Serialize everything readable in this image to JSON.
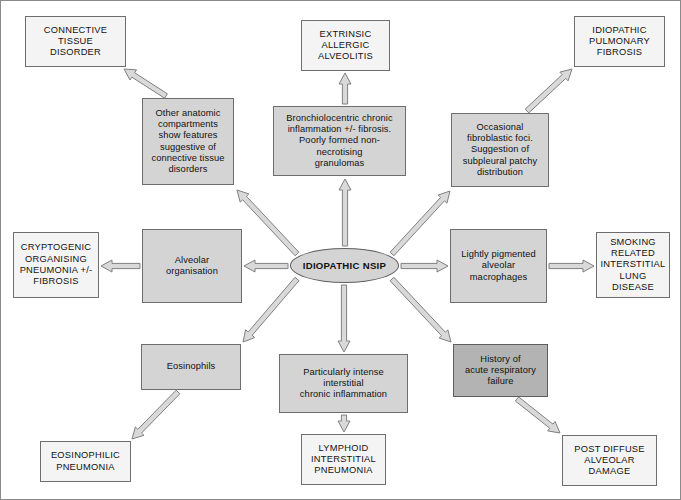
{
  "diagram": {
    "type": "radial-flow-chart",
    "colors": {
      "outcome_fill": "#f4f4f4",
      "feature_fill": "#d4d4d4",
      "feature_dark_fill": "#b3b3b3",
      "border": "#6e6e6e",
      "arrow_stroke": "#808080",
      "arrow_fill": "#d9d9d9",
      "text": "#111111",
      "canvas": "#ffffff"
    },
    "hub": {
      "id": "hub",
      "label": "IDIOPATHIC NSIP",
      "shape": "ellipse",
      "x": 289,
      "y": 247,
      "w": 109,
      "h": 35
    },
    "feature_nodes": [
      {
        "id": "other-anatomic-compartments",
        "label": "Other anatomic\ncompartments\nshow features\nsuggestive of\nconnective tissue\ndisorders",
        "style": "feature",
        "x": 141,
        "y": 97,
        "w": 92,
        "h": 87
      },
      {
        "id": "bronchiolocentric-inflammation",
        "label": "Bronchiolocentric chronic\ninflammation +/- fibrosis.\nPoorly formed non-necrotising\ngranulomas",
        "style": "feature",
        "x": 272,
        "y": 105,
        "w": 133,
        "h": 70
      },
      {
        "id": "fibroblastic-foci",
        "label": "Occasional\nfibroblastic foci.\nSuggestion of\nsubpleural patchy\ndistribution",
        "style": "feature",
        "x": 450,
        "y": 112,
        "w": 98,
        "h": 74
      },
      {
        "id": "alveolar-organisation",
        "label": "Alveolar\norganisation",
        "style": "feature",
        "x": 141,
        "y": 228,
        "w": 100,
        "h": 74
      },
      {
        "id": "lightly-pigmented-macrophages",
        "label": "Lightly pigmented\nalveolar\nmacrophages",
        "style": "feature",
        "x": 449,
        "y": 228,
        "w": 97,
        "h": 74
      },
      {
        "id": "eosinophils",
        "label": "Eosinophils",
        "style": "feature",
        "x": 140,
        "y": 343,
        "w": 100,
        "h": 46
      },
      {
        "id": "intense-interstitial-inflammation",
        "label": "Particularly intense\ninterstitial\nchronic inflammation",
        "style": "feature",
        "x": 278,
        "y": 353,
        "w": 129,
        "h": 59
      },
      {
        "id": "acute-respiratory-failure",
        "label": "History of\nacute respiratory\nfailure",
        "style": "feature-dark",
        "x": 452,
        "y": 343,
        "w": 95,
        "h": 53
      }
    ],
    "outcome_nodes": [
      {
        "id": "connective-tissue-disorder",
        "label": "CONNECTIVE\nTISSUE\nDISORDER",
        "style": "outcome",
        "x": 24,
        "y": 15,
        "w": 101,
        "h": 51
      },
      {
        "id": "extrinsic-allergic-alveolitis",
        "label": "EXTRINSIC\nALLERGIC\nALVEOLITIS",
        "style": "outcome",
        "x": 300,
        "y": 19,
        "w": 89,
        "h": 51
      },
      {
        "id": "idiopathic-pulmonary-fibrosis",
        "label": "IDIOPATHIC\nPULMONARY\nFIBROSIS",
        "style": "outcome",
        "x": 573,
        "y": 15,
        "w": 91,
        "h": 51
      },
      {
        "id": "cryptogenic-organising-pneumonia",
        "label": "CRYPTOGENIC\nORGANISING\nPNEUMONIA +/-\nFIBROSIS",
        "style": "outcome",
        "x": 12,
        "y": 231,
        "w": 86,
        "h": 66
      },
      {
        "id": "smoking-related-interstitial-lung-disease",
        "label": "SMOKING\nRELATED\nINTERSTITIAL\nLUNG DISEASE",
        "style": "outcome",
        "x": 595,
        "y": 231,
        "w": 74,
        "h": 66
      },
      {
        "id": "eosinophilic-pneumonia",
        "label": "EOSINOPHILIC\nPNEUMONIA",
        "style": "outcome",
        "x": 39,
        "y": 440,
        "w": 91,
        "h": 41
      },
      {
        "id": "lymphoid-interstitial-pneumonia",
        "label": "LYMPHOID\nINTERSTITIAL\nPNEUMONIA",
        "style": "outcome",
        "x": 300,
        "y": 433,
        "w": 85,
        "h": 51
      },
      {
        "id": "post-diffuse-alveolar-damage",
        "label": "POST DIFFUSE\nALVEOLAR\nDAMAGE",
        "style": "outcome",
        "x": 561,
        "y": 434,
        "w": 95,
        "h": 51
      }
    ],
    "edges": [
      {
        "id": "hub-to-other-anatomic",
        "from": "hub",
        "to": "other-anatomic-compartments",
        "x1": 296,
        "y1": 253,
        "x2": 236,
        "y2": 189
      },
      {
        "id": "other-anatomic-to-ctd",
        "from": "other-anatomic-compartments",
        "to": "connective-tissue-disorder",
        "x1": 165,
        "y1": 95,
        "x2": 123,
        "y2": 68
      },
      {
        "id": "hub-to-bronchiolocentric",
        "from": "hub",
        "to": "bronchiolocentric-inflammation",
        "x1": 344,
        "y1": 245,
        "x2": 344,
        "y2": 178
      },
      {
        "id": "bronchiolocentric-to-eaa",
        "from": "bronchiolocentric-inflammation",
        "to": "extrinsic-allergic-alveolitis",
        "x1": 344,
        "y1": 103,
        "x2": 344,
        "y2": 72
      },
      {
        "id": "hub-to-fibroblastic-foci",
        "from": "hub",
        "to": "fibroblastic-foci",
        "x1": 391,
        "y1": 253,
        "x2": 449,
        "y2": 190
      },
      {
        "id": "fibroblastic-foci-to-ipf",
        "from": "fibroblastic-foci",
        "to": "idiopathic-pulmonary-fibrosis",
        "x1": 526,
        "y1": 110,
        "x2": 571,
        "y2": 68
      },
      {
        "id": "hub-to-alveolar-organisation",
        "from": "hub",
        "to": "alveolar-organisation",
        "x1": 287,
        "y1": 265,
        "x2": 243,
        "y2": 265
      },
      {
        "id": "alveolar-organisation-to-cop",
        "from": "alveolar-organisation",
        "to": "cryptogenic-organising-pneumonia",
        "x1": 139,
        "y1": 265,
        "x2": 100,
        "y2": 265
      },
      {
        "id": "hub-to-macrophages",
        "from": "hub",
        "to": "lightly-pigmented-macrophages",
        "x1": 400,
        "y1": 265,
        "x2": 447,
        "y2": 265
      },
      {
        "id": "macrophages-to-srild",
        "from": "lightly-pigmented-macrophages",
        "to": "smoking-related-interstitial-lung-disease",
        "x1": 548,
        "y1": 265,
        "x2": 593,
        "y2": 265
      },
      {
        "id": "hub-to-eosinophils",
        "from": "hub",
        "to": "eosinophils",
        "x1": 296,
        "y1": 278,
        "x2": 242,
        "y2": 341
      },
      {
        "id": "eosinophils-to-eosinophilic-pneumonia",
        "from": "eosinophils",
        "to": "eosinophilic-pneumonia",
        "x1": 177,
        "y1": 391,
        "x2": 131,
        "y2": 438
      },
      {
        "id": "hub-to-intense-inflammation",
        "from": "hub",
        "to": "intense-interstitial-inflammation",
        "x1": 343,
        "y1": 284,
        "x2": 343,
        "y2": 351
      },
      {
        "id": "intense-inflammation-to-lip",
        "from": "intense-interstitial-inflammation",
        "to": "lymphoid-interstitial-pneumonia",
        "x1": 343,
        "y1": 414,
        "x2": 343,
        "y2": 431
      },
      {
        "id": "hub-to-ars-failure",
        "from": "hub",
        "to": "acute-respiratory-failure",
        "x1": 391,
        "y1": 278,
        "x2": 450,
        "y2": 341
      },
      {
        "id": "ars-failure-to-post-dad",
        "from": "acute-respiratory-failure",
        "to": "post-diffuse-alveolar-damage",
        "x1": 516,
        "y1": 398,
        "x2": 559,
        "y2": 432
      }
    ]
  }
}
